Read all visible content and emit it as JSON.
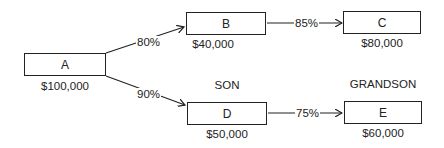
{
  "diagram": {
    "type": "ownership-tree",
    "nodes": [
      {
        "id": "A",
        "label": "A",
        "amount": "$100,000"
      },
      {
        "id": "B",
        "label": "B",
        "amount": "$40,000"
      },
      {
        "id": "C",
        "label": "C",
        "amount": "$80,000"
      },
      {
        "id": "D",
        "label": "D",
        "amount": "$50,000",
        "role": "SON"
      },
      {
        "id": "E",
        "label": "E",
        "amount": "$60,000",
        "role": "GRANDSON"
      }
    ],
    "edges": [
      {
        "from": "A",
        "to": "B",
        "label": "80%"
      },
      {
        "from": "A",
        "to": "D",
        "label": "90%"
      },
      {
        "from": "B",
        "to": "C",
        "label": "85%"
      },
      {
        "from": "D",
        "to": "E",
        "label": "75%"
      }
    ],
    "colors": {
      "line": "#222222",
      "background": "#ffffff"
    }
  }
}
